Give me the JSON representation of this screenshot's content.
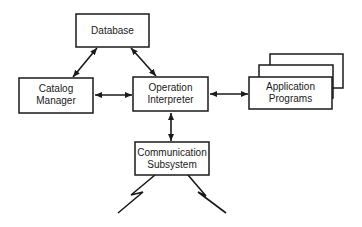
{
  "diagram": {
    "type": "block-diagram",
    "colors": {
      "stroke": "#1a1a1a",
      "background": "#ffffff",
      "text": "#1a1a1a"
    },
    "nodes": {
      "database": {
        "label_lines": [
          "Database"
        ]
      },
      "catalog_manager": {
        "label_lines": [
          "Catalog",
          "Manager"
        ]
      },
      "operation_interpreter": {
        "label_lines": [
          "Operation",
          "Interpreter"
        ]
      },
      "application_programs": {
        "label_lines": [
          "Application",
          "Programs"
        ],
        "stacked_count": 3
      },
      "communication_subsystem": {
        "label_lines": [
          "Communication",
          "Subsystem"
        ]
      }
    },
    "edges": [
      {
        "from": "database",
        "to": "catalog_manager",
        "direction": "bidirectional"
      },
      {
        "from": "database",
        "to": "operation_interpreter",
        "direction": "bidirectional"
      },
      {
        "from": "catalog_manager",
        "to": "operation_interpreter",
        "direction": "bidirectional"
      },
      {
        "from": "operation_interpreter",
        "to": "application_programs",
        "direction": "bidirectional"
      },
      {
        "from": "operation_interpreter",
        "to": "communication_subsystem",
        "direction": "bidirectional"
      }
    ],
    "external_links": [
      {
        "from": "communication_subsystem",
        "symbol": "lightning-link",
        "side": "left"
      },
      {
        "from": "communication_subsystem",
        "symbol": "lightning-link",
        "side": "right"
      }
    ]
  }
}
